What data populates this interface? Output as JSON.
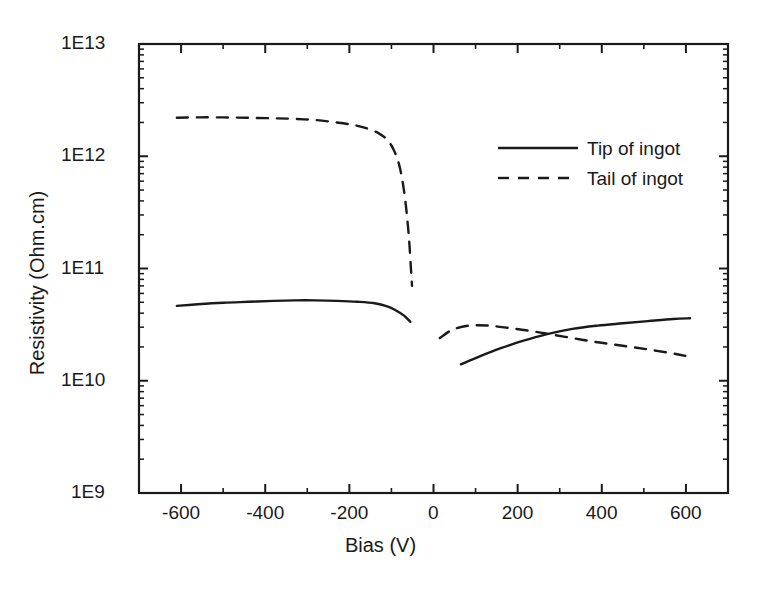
{
  "chart_data": {
    "type": "line",
    "title": "",
    "xlabel": "Bias (V)",
    "ylabel": "Resistivity (Ohm.cm)",
    "xlim": [
      -700,
      700
    ],
    "ylim": [
      1000000000.0,
      10000000000000.0
    ],
    "yscale": "log",
    "xscale": "linear",
    "grid": false,
    "legend_position": "upper-right-inside",
    "xticks": [
      -600,
      -400,
      -200,
      0,
      200,
      400,
      600
    ],
    "xtick_labels": [
      "-600",
      "-400",
      "-200",
      "0",
      "200",
      "400",
      "600"
    ],
    "xtick_step_minor": 100,
    "yticks": [
      1000000000.0,
      10000000000.0,
      100000000000.0,
      1000000000000.0,
      10000000000000.0
    ],
    "ytick_labels": [
      "1E9",
      "1E10",
      "1E11",
      "1E12",
      "1E13"
    ],
    "series": [
      {
        "name": "Tip of ingot",
        "style": "solid",
        "color": "#1a1a1a",
        "segments": [
          {
            "branch": "negative-bias",
            "x": [
              -610,
              -560,
              -500,
              -440,
              -380,
              -330,
              -280,
              -230,
              -180,
              -140,
              -110,
              -90,
              -70,
              -55
            ],
            "y": [
              46500000000.0,
              48000000000.0,
              49500000000.0,
              50500000000.0,
              51500000000.0,
              52000000000.0,
              52000000000.0,
              51500000000.0,
              50500000000.0,
              49000000000.0,
              46000000000.0,
              42500000000.0,
              38000000000.0,
              33500000000.0
            ]
          },
          {
            "branch": "positive-bias",
            "x": [
              65,
              110,
              160,
              210,
              270,
              330,
              390,
              450,
              510,
              570,
              610
            ],
            "y": [
              14000000000.0,
              16500000000.0,
              19500000000.0,
              22500000000.0,
              26000000000.0,
              29000000000.0,
              31000000000.0,
              32500000000.0,
              34000000000.0,
              35500000000.0,
              36000000000.0
            ]
          }
        ]
      },
      {
        "name": "Tail of ingot",
        "style": "dashed",
        "color": "#1a1a1a",
        "segments": [
          {
            "branch": "negative-bias",
            "x": [
              -610,
              -560,
              -500,
              -440,
              -380,
              -330,
              -280,
              -230,
              -190,
              -160,
              -130,
              -110,
              -95,
              -82,
              -72,
              -64,
              -58,
              -54,
              -51
            ],
            "y": [
              2200000000000.0,
              2220000000000.0,
              2220000000000.0,
              2200000000000.0,
              2180000000000.0,
              2150000000000.0,
              2100000000000.0,
              2000000000000.0,
              1900000000000.0,
              1780000000000.0,
              1600000000000.0,
              1400000000000.0,
              1150000000000.0,
              850000000000.0,
              550000000000.0,
              320000000000.0,
              180000000000.0,
              105000000000.0,
              70000000000.0
            ]
          },
          {
            "branch": "positive-bias",
            "x": [
              15,
              45,
              85,
              130,
              180,
              230,
              270,
              330,
              390,
              450,
              510,
              570,
              605
            ],
            "y": [
              24000000000.0,
              28500000000.0,
              31000000000.0,
              31000000000.0,
              29500000000.0,
              27800000000.0,
              26200000000.0,
              24000000000.0,
              22000000000.0,
              20500000000.0,
              19000000000.0,
              17500000000.0,
              16500000000.0
            ]
          }
        ]
      }
    ],
    "annotations": [],
    "crossing_point": {
      "x": 270,
      "y": 26000000000.0
    }
  },
  "legend": {
    "entries": [
      {
        "label": "Tip of ingot",
        "style": "solid"
      },
      {
        "label": "Tail of ingot",
        "style": "dashed"
      }
    ]
  },
  "axes": {
    "x_title": "Bias (V)",
    "y_title": "Resistivity (Ohm.cm)"
  }
}
